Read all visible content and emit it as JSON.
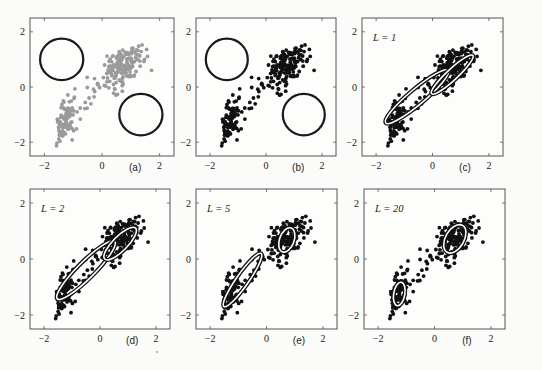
{
  "figure": {
    "panels": [
      {
        "id": "a",
        "label": "(a)",
        "L_text": null,
        "point_color": "#9a9a9a",
        "frame": {
          "x": 30,
          "y": 18,
          "w": 144,
          "h": 138
        },
        "components": [
          {
            "type": "circle",
            "cx": -1.4,
            "cy": 1.0,
            "r": 0.75
          },
          {
            "type": "circle",
            "cx": 1.35,
            "cy": -1.0,
            "r": 0.75
          }
        ]
      },
      {
        "id": "b",
        "label": "(b)",
        "L_text": null,
        "point_color": "#111111",
        "frame": {
          "x": 196,
          "y": 18,
          "w": 140,
          "h": 138
        },
        "components": [
          {
            "type": "circle",
            "cx": -1.4,
            "cy": 1.0,
            "r": 0.75
          },
          {
            "type": "circle",
            "cx": 1.35,
            "cy": -1.0,
            "r": 0.75
          }
        ]
      },
      {
        "id": "c",
        "label": "(c)",
        "L_text": "L = 1",
        "L_var": "L",
        "L_val": "1",
        "point_color": "#111111",
        "frame": {
          "x": 362,
          "y": 18,
          "w": 141,
          "h": 138
        },
        "components": [
          {
            "type": "ellipse",
            "cx": -0.55,
            "cy": -0.35,
            "rx": 1.45,
            "ry": 0.28,
            "angle": 40
          },
          {
            "type": "ellipse",
            "cx": 0.7,
            "cy": 0.45,
            "rx": 1.0,
            "ry": 0.2,
            "angle": 43
          }
        ]
      },
      {
        "id": "d",
        "label": "(d)",
        "L_text": "L = 2",
        "L_var": "L",
        "L_val": "2",
        "point_color": "#111111",
        "frame": {
          "x": 30,
          "y": 189,
          "w": 140,
          "h": 140
        },
        "components": [
          {
            "type": "ellipse",
            "cx": -0.5,
            "cy": -0.4,
            "rx": 1.45,
            "ry": 0.3,
            "angle": 45
          },
          {
            "type": "ellipse",
            "cx": 0.72,
            "cy": 0.55,
            "rx": 0.78,
            "ry": 0.26,
            "angle": 45
          }
        ]
      },
      {
        "id": "e",
        "label": "(e)",
        "L_text": "L = 5",
        "L_var": "L",
        "L_val": "5",
        "point_color": "#111111",
        "frame": {
          "x": 196,
          "y": 189,
          "w": 141,
          "h": 140
        },
        "components": [
          {
            "type": "ellipse",
            "cx": -0.85,
            "cy": -0.75,
            "rx": 1.15,
            "ry": 0.22,
            "angle": 55
          },
          {
            "type": "ellipse",
            "cx": 0.72,
            "cy": 0.68,
            "rx": 0.45,
            "ry": 0.26,
            "angle": 70
          }
        ]
      },
      {
        "id": "f",
        "label": "(f)",
        "L_text": "L = 20",
        "L_var": "L",
        "L_val": "20",
        "point_color": "#111111",
        "frame": {
          "x": 364,
          "y": 189,
          "w": 141,
          "h": 140
        },
        "components": [
          {
            "type": "ellipse",
            "cx": -1.25,
            "cy": -1.25,
            "rx": 0.42,
            "ry": 0.2,
            "angle": 80
          },
          {
            "type": "ellipse",
            "cx": 0.72,
            "cy": 0.72,
            "rx": 0.55,
            "ry": 0.33,
            "angle": 60
          }
        ]
      }
    ],
    "axis": {
      "xlim": [
        -2.5,
        2.5
      ],
      "ylim": [
        -2.5,
        2.5
      ],
      "xticks": [
        -2,
        0,
        2
      ],
      "yticks": [
        -2,
        0,
        2
      ],
      "xtick_labels": [
        "−2",
        "0",
        "2"
      ],
      "ytick_labels": [
        "2",
        "0",
        "−2"
      ]
    }
  },
  "chart_data": {
    "type": "scatter",
    "title": "",
    "xlabel": "",
    "ylabel": "",
    "xlim": [
      -2.5,
      2.5
    ],
    "ylim": [
      -2.5,
      2.5
    ],
    "xticks": [
      -2,
      0,
      2
    ],
    "yticks": [
      -2,
      0,
      2
    ],
    "grid": false,
    "panels": [
      "(a)",
      "(b)",
      "(c) L = 1",
      "(d) L = 2",
      "(e) L = 5",
      "(f) L = 20"
    ],
    "series": [
      {
        "name": "cluster-upper-right",
        "n": 170,
        "mean": [
          0.72,
          0.72
        ],
        "std": [
          0.32,
          0.35
        ],
        "corr": 0.35
      },
      {
        "name": "cluster-lower-left",
        "n": 95,
        "mean": [
          -1.28,
          -1.25
        ],
        "std": [
          0.17,
          0.4
        ],
        "corr": 0.3
      },
      {
        "name": "bridge-points",
        "n": 18,
        "mean": [
          -0.3,
          -0.2
        ],
        "std": [
          0.4,
          0.35
        ],
        "corr": 0.6
      }
    ],
    "seed": 7,
    "annotations": [
      "L = 1",
      "L = 2",
      "L = 5",
      "L = 20"
    ]
  }
}
